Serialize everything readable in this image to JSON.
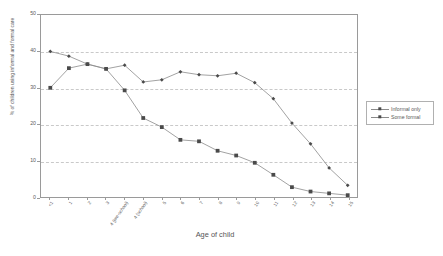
{
  "chart_data": {
    "type": "line",
    "title": "",
    "xlabel": "Age of child",
    "ylabel": "% of children using informal and formal care",
    "ylim": [
      0,
      50
    ],
    "yticks": [
      0,
      10,
      20,
      30,
      40,
      50
    ],
    "grid": true,
    "legend_position": "right-outside",
    "categories": [
      "<1",
      "1",
      "2",
      "3",
      "4 (pre-school)",
      "4 (school)",
      "5",
      "6",
      "7",
      "8",
      "9",
      "10",
      "11",
      "12",
      "13",
      "14",
      "15"
    ],
    "series": [
      {
        "name": "Informal only",
        "marker": "diamond",
        "color": "#4a4a4a",
        "values": [
          40.0,
          38.7,
          36.5,
          35.2,
          36.2,
          31.6,
          32.2,
          34.4,
          33.6,
          33.3,
          34.0,
          31.4,
          27.0,
          20.3,
          14.6,
          8.0,
          3.2
        ]
      },
      {
        "name": "Some formal",
        "marker": "square",
        "color": "#4a4a4a",
        "values": [
          30.0,
          35.4,
          36.5,
          35.2,
          29.3,
          21.7,
          19.2,
          15.7,
          15.3,
          12.7,
          11.4,
          9.4,
          6.1,
          2.7,
          1.5,
          1.0,
          0.5
        ]
      }
    ]
  },
  "legend": {
    "items": [
      {
        "label": "Informal only"
      },
      {
        "label": "Some formal"
      }
    ]
  }
}
